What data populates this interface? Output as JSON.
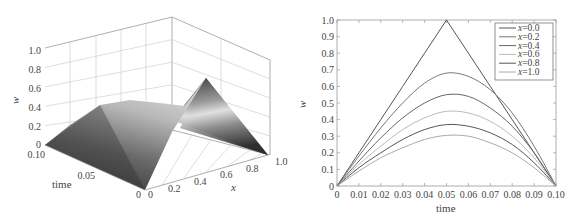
{
  "chart_data": [
    {
      "type": "surface3d",
      "title": "",
      "xlabel": "x",
      "ylabel": "time",
      "zlabel": "w",
      "x_ticks": [
        "0",
        "0.2",
        "0.4",
        "0.6",
        "0.8",
        "1.0"
      ],
      "time_ticks": [
        "0",
        "0.05",
        "0.10"
      ],
      "z_ticks": [
        "0",
        "0.2",
        "0.4",
        "0.6",
        "0.8",
        "1.0"
      ],
      "xlim": [
        0,
        1.0
      ],
      "timelim": [
        0,
        0.1
      ],
      "zlim": [
        0,
        1.0
      ],
      "grid": true,
      "colormap": "grayscale",
      "description": "Surface w(x,time): at x=0 a triangular pulse peaking at 1.0 at time=0.05; amplitude decays with x to ~0.3 at x=1.0"
    },
    {
      "type": "line",
      "title": "",
      "xlabel": "time",
      "ylabel": "w",
      "xlim": [
        0,
        0.1
      ],
      "ylim": [
        0,
        1.0
      ],
      "x_ticks": [
        "0",
        "0.01",
        "0.02",
        "0.03",
        "0.04",
        "0.05",
        "0.06",
        "0.07",
        "0.08",
        "0.09",
        "0.10"
      ],
      "y_ticks": [
        "0",
        "0.1",
        "0.2",
        "0.3",
        "0.4",
        "0.5",
        "0.6",
        "0.7",
        "0.8",
        "0.9",
        "1.0"
      ],
      "legend_position": "upper right",
      "x": [
        0,
        0.01,
        0.02,
        0.03,
        0.04,
        0.05,
        0.06,
        0.07,
        0.08,
        0.09,
        0.1
      ],
      "series": [
        {
          "name": "x=0.0",
          "color": "#555555",
          "values": [
            0,
            0.2,
            0.4,
            0.6,
            0.8,
            1.0,
            0.8,
            0.6,
            0.4,
            0.2,
            0
          ]
        },
        {
          "name": "x=0.2",
          "color": "#777777",
          "values": [
            0,
            0.18,
            0.35,
            0.5,
            0.62,
            0.68,
            0.66,
            0.58,
            0.44,
            0.24,
            0
          ]
        },
        {
          "name": "x=0.4",
          "color": "#666666",
          "values": [
            0,
            0.15,
            0.29,
            0.41,
            0.5,
            0.55,
            0.54,
            0.47,
            0.36,
            0.2,
            0
          ]
        },
        {
          "name": "x=0.6",
          "color": "#bbbbbb",
          "values": [
            0,
            0.13,
            0.24,
            0.34,
            0.41,
            0.45,
            0.44,
            0.39,
            0.3,
            0.17,
            0
          ]
        },
        {
          "name": "x=0.8",
          "color": "#555555",
          "values": [
            0,
            0.11,
            0.2,
            0.28,
            0.34,
            0.37,
            0.36,
            0.32,
            0.25,
            0.14,
            0
          ]
        },
        {
          "name": "x=1.0",
          "color": "#aaaaaa",
          "values": [
            0,
            0.09,
            0.17,
            0.23,
            0.28,
            0.305,
            0.3,
            0.26,
            0.2,
            0.11,
            0
          ]
        }
      ]
    }
  ],
  "left": {
    "zlabel": "w",
    "ylabel": "time",
    "xlabel": "x",
    "z_ticks": [
      "0",
      "0.2",
      "0.4",
      "0.6",
      "0.8",
      "1.0"
    ],
    "time_ticks": [
      "0.10",
      "0.05",
      "0"
    ],
    "x_ticks": [
      "0",
      "0.2",
      "0.4",
      "0.6",
      "0.8",
      "1.0"
    ]
  },
  "right": {
    "xlabel": "time",
    "ylabel": "w",
    "x_ticks": [
      "0",
      "0.01",
      "0.02",
      "0.03",
      "0.04",
      "0.05",
      "0.06",
      "0.07",
      "0.08",
      "0.09",
      "0.10"
    ],
    "y_ticks": [
      "0",
      "0.1",
      "0.2",
      "0.3",
      "0.4",
      "0.5",
      "0.6",
      "0.7",
      "0.8",
      "0.9",
      "1.0"
    ],
    "legend": [
      {
        "var": "x",
        "rest": "=0.0",
        "color": "#555555"
      },
      {
        "var": "x",
        "rest": "=0.2",
        "color": "#777777"
      },
      {
        "var": "x",
        "rest": "=0.4",
        "color": "#666666"
      },
      {
        "var": "x",
        "rest": "=0.6",
        "color": "#bbbbbb"
      },
      {
        "var": "x",
        "rest": "=0.8",
        "color": "#555555"
      },
      {
        "var": "x",
        "rest": "=1.0",
        "color": "#aaaaaa"
      }
    ]
  }
}
